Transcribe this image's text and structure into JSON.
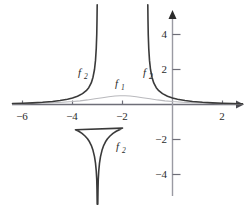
{
  "chart_data": {
    "type": "line",
    "title": "",
    "subtitle": "",
    "xlabel": "",
    "ylabel": "",
    "xlim": [
      -6.4,
      2.8
    ],
    "ylim": [
      -5.7,
      5.7
    ],
    "grid": false,
    "legend_position": "inline-annotations",
    "background_color": "#ffffff",
    "axis_color": "#6e6e78",
    "x_ticks": [
      -6,
      -4,
      -2,
      2
    ],
    "x_tick_labels": [
      "−6",
      "−4",
      "−2",
      "2"
    ],
    "y_ticks": [
      4,
      2,
      -2,
      -4
    ],
    "y_tick_labels": [
      "4",
      "2",
      "−2",
      "−4"
    ],
    "annotations": [
      {
        "text": "f",
        "subscript": "2",
        "x": -5.6,
        "y": 1.9,
        "color": "#3a3a3a"
      },
      {
        "text": "f",
        "subscript": "1",
        "x": -2.2,
        "y": 1.25,
        "color": "#3a3a3a"
      },
      {
        "text": "f",
        "subscript": "2",
        "x": -1.0,
        "y": 1.9,
        "color": "#3a3a3a"
      },
      {
        "text": "f",
        "subscript": "2",
        "x": -2.1,
        "y": -2.4,
        "color": "#3a3a3a"
      }
    ],
    "series": [
      {
        "name": "f1",
        "label": "f₁",
        "color": "#b9b9bd",
        "width": 1.1,
        "description": "smooth bell-shaped curve, maximum about 0.5 at x = -2, decaying toward 0 on both sides",
        "points": [
          [
            -6.4,
            0.035
          ],
          [
            -6.0,
            0.045
          ],
          [
            -5.6,
            0.058
          ],
          [
            -5.2,
            0.075
          ],
          [
            -4.8,
            0.098
          ],
          [
            -4.4,
            0.13
          ],
          [
            -4.0,
            0.17
          ],
          [
            -3.7,
            0.21
          ],
          [
            -3.4,
            0.262
          ],
          [
            -3.1,
            0.325
          ],
          [
            -2.8,
            0.39
          ],
          [
            -2.55,
            0.443
          ],
          [
            -2.3,
            0.482
          ],
          [
            -2.1,
            0.497
          ],
          [
            -2.0,
            0.5
          ],
          [
            -1.9,
            0.497
          ],
          [
            -1.7,
            0.482
          ],
          [
            -1.45,
            0.443
          ],
          [
            -1.2,
            0.39
          ],
          [
            -0.9,
            0.325
          ],
          [
            -0.6,
            0.262
          ],
          [
            -0.3,
            0.21
          ],
          [
            0.0,
            0.17
          ],
          [
            0.4,
            0.13
          ],
          [
            0.8,
            0.098
          ],
          [
            1.2,
            0.075
          ],
          [
            1.6,
            0.058
          ],
          [
            2.0,
            0.045
          ],
          [
            2.4,
            0.036
          ],
          [
            2.8,
            0.029
          ]
        ]
      },
      {
        "name": "f2_left_branch",
        "label": "f₂",
        "color": "#3a3a3a",
        "width": 1.6,
        "description": "left outer branch rising to +infinity at the vertical asymptote x = -3",
        "points": [
          [
            -6.4,
            0.055
          ],
          [
            -6.0,
            0.072
          ],
          [
            -5.6,
            0.095
          ],
          [
            -5.2,
            0.128
          ],
          [
            -4.8,
            0.175
          ],
          [
            -4.5,
            0.225
          ],
          [
            -4.2,
            0.3
          ],
          [
            -4.0,
            0.37
          ],
          [
            -3.8,
            0.47
          ],
          [
            -3.6,
            0.62
          ],
          [
            -3.45,
            0.79
          ],
          [
            -3.35,
            0.96
          ],
          [
            -3.25,
            1.23
          ],
          [
            -3.18,
            1.56
          ],
          [
            -3.12,
            2.0
          ],
          [
            -3.08,
            2.52
          ],
          [
            -3.05,
            3.2
          ],
          [
            -3.03,
            4.0
          ],
          [
            -3.02,
            4.8
          ],
          [
            -3.012,
            5.7
          ]
        ]
      },
      {
        "name": "f2_right_branch",
        "label": "f₂",
        "color": "#3a3a3a",
        "width": 1.6,
        "description": "right outer branch rising to +infinity at the vertical asymptote x = -1",
        "points": [
          [
            -0.988,
            5.7
          ],
          [
            -0.98,
            4.8
          ],
          [
            -0.97,
            4.0
          ],
          [
            -0.95,
            3.2
          ],
          [
            -0.92,
            2.52
          ],
          [
            -0.88,
            2.0
          ],
          [
            -0.82,
            1.56
          ],
          [
            -0.75,
            1.23
          ],
          [
            -0.65,
            0.96
          ],
          [
            -0.55,
            0.79
          ],
          [
            -0.4,
            0.62
          ],
          [
            -0.2,
            0.47
          ],
          [
            0.0,
            0.37
          ],
          [
            0.2,
            0.3
          ],
          [
            0.5,
            0.225
          ],
          [
            0.8,
            0.175
          ],
          [
            1.2,
            0.128
          ],
          [
            1.6,
            0.095
          ],
          [
            2.0,
            0.072
          ],
          [
            2.4,
            0.058
          ],
          [
            2.8,
            0.047
          ]
        ]
      },
      {
        "name": "f2_middle_branch",
        "label": "f₂",
        "color": "#3a3a3a",
        "width": 1.6,
        "description": "middle branch, an inverted arch between the asymptotes x = -3 and x = -1, maximum about -1.35 at x = -2, falling to -infinity at each asymptote",
        "points": [
          [
            -3.012,
            -5.7
          ],
          [
            -3.02,
            -4.9
          ],
          [
            -3.03,
            -4.3
          ],
          [
            -3.05,
            -3.8
          ],
          [
            -3.08,
            -3.35
          ],
          [
            -3.12,
            -2.98
          ],
          [
            -3.18,
            -2.62
          ],
          [
            -3.25,
            -2.33
          ],
          [
            -3.32,
            -2.13
          ],
          [
            -3.4,
            -1.96
          ],
          [
            -3.5,
            -1.8
          ],
          [
            -3.62,
            -1.65
          ],
          [
            -3.75,
            -1.53
          ],
          [
            -3.88,
            -1.44
          ],
          [
            -2.0,
            -1.35
          ],
          [
            -2.12,
            -1.44
          ],
          [
            -2.25,
            -1.53
          ],
          [
            -2.38,
            -1.65
          ],
          [
            -2.5,
            -1.8
          ],
          [
            -2.6,
            -1.96
          ],
          [
            -2.68,
            -2.13
          ],
          [
            -2.75,
            -2.33
          ],
          [
            -2.82,
            -2.62
          ],
          [
            -2.88,
            -2.98
          ],
          [
            -2.92,
            -3.35
          ],
          [
            -2.95,
            -3.8
          ],
          [
            -2.97,
            -4.3
          ],
          [
            -2.98,
            -4.9
          ],
          [
            -2.988,
            -5.7
          ]
        ]
      }
    ]
  }
}
